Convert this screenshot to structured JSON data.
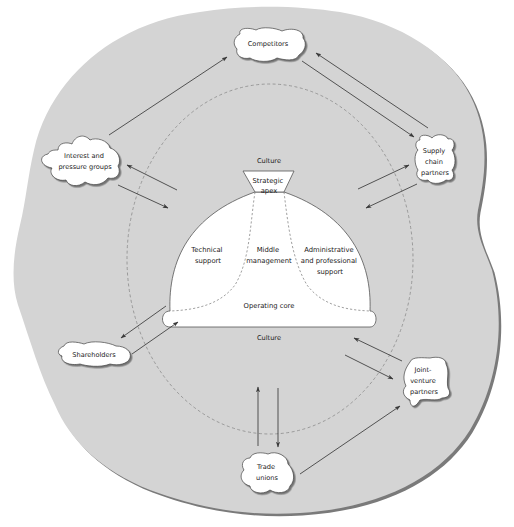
{
  "diagram": {
    "colors": {
      "background": "#ffffff",
      "environment_fill": "#d4d4d4",
      "environment_edge": "#7a7a7a",
      "organisation_fill": "#ffffff",
      "stroke": "#3a3a3a",
      "dashed": "#8a8a8a",
      "text": "#1a1a1a"
    },
    "culture_labels": {
      "top": "Culture",
      "bottom": "Culture"
    },
    "organisation": {
      "strategic_apex": [
        "Strategic",
        "apex"
      ],
      "technical_support": [
        "Technical",
        "support"
      ],
      "middle_management": [
        "Middle",
        "management"
      ],
      "administrative_support": [
        "Administrative",
        "and professional",
        "support"
      ],
      "operating_core": "Operating core"
    },
    "stakeholders": {
      "competitors": [
        "Competitors"
      ],
      "interest_groups": [
        "Interest and",
        "pressure groups"
      ],
      "supply_chain": [
        "Supply",
        "chain",
        "partners"
      ],
      "shareholders": [
        "Shareholders"
      ],
      "joint_venture": [
        "Joint-",
        "venture",
        "partners"
      ],
      "trade_unions": [
        "Trade",
        "unions"
      ]
    },
    "relationships": [
      {
        "from": "Interest and pressure groups",
        "to": "Competitors"
      },
      {
        "from": "Competitors",
        "to": "Supply chain partners"
      },
      {
        "from": "Supply chain partners",
        "to": "Competitors"
      },
      {
        "from": "Organisation",
        "to": "Interest and pressure groups"
      },
      {
        "from": "Interest and pressure groups",
        "to": "Organisation"
      },
      {
        "from": "Organisation",
        "to": "Supply chain partners"
      },
      {
        "from": "Supply chain partners",
        "to": "Organisation"
      },
      {
        "from": "Organisation",
        "to": "Shareholders"
      },
      {
        "from": "Shareholders",
        "to": "Organisation"
      },
      {
        "from": "Joint-venture partners",
        "to": "Organisation"
      },
      {
        "from": "Organisation",
        "to": "Joint-venture partners"
      },
      {
        "from": "Trade unions",
        "to": "Organisation"
      },
      {
        "from": "Organisation",
        "to": "Trade unions"
      },
      {
        "from": "Trade unions",
        "to": "Joint-venture partners"
      }
    ]
  }
}
